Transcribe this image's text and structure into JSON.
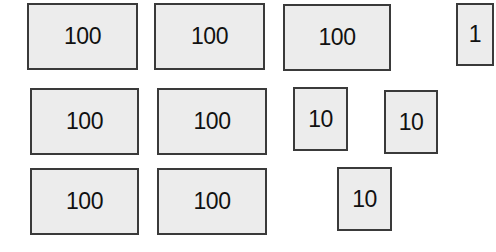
{
  "colors": {
    "fill": "#ececec",
    "border": "#3a3a3a",
    "text": "#111111",
    "background": "#ffffff"
  },
  "blocks": [
    {
      "label": "100",
      "x": 27,
      "y": 3,
      "w": 111,
      "h": 67
    },
    {
      "label": "100",
      "x": 154,
      "y": 3,
      "w": 111,
      "h": 67
    },
    {
      "label": "100",
      "x": 283,
      "y": 4,
      "w": 108,
      "h": 67
    },
    {
      "label": "1",
      "x": 456,
      "y": 3,
      "w": 38,
      "h": 63
    },
    {
      "label": "100",
      "x": 30,
      "y": 88,
      "w": 109,
      "h": 67
    },
    {
      "label": "100",
      "x": 157,
      "y": 88,
      "w": 110,
      "h": 67
    },
    {
      "label": "10",
      "x": 293,
      "y": 87,
      "w": 55,
      "h": 64
    },
    {
      "label": "10",
      "x": 384,
      "y": 90,
      "w": 54,
      "h": 64
    },
    {
      "label": "100",
      "x": 30,
      "y": 168,
      "w": 109,
      "h": 67
    },
    {
      "label": "100",
      "x": 157,
      "y": 168,
      "w": 110,
      "h": 67
    },
    {
      "label": "10",
      "x": 337,
      "y": 167,
      "w": 55,
      "h": 64
    }
  ]
}
